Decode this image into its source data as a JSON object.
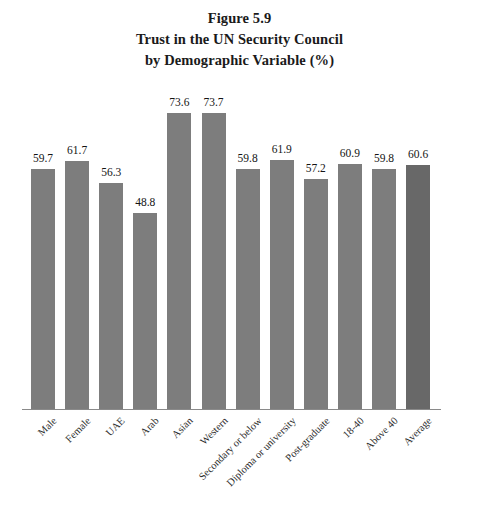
{
  "title": {
    "line1": "Figure 5.9",
    "line2": "Trust in the UN Security Council",
    "line3": "by Demographic Variable (%)"
  },
  "chart_data": {
    "type": "bar",
    "title": "Figure 5.9 Trust in the UN Security Council by Demographic Variable (%)",
    "xlabel": "",
    "ylabel": "",
    "ylim": [
      0,
      80
    ],
    "grid": false,
    "legend": "none",
    "axis": {
      "x_line_visible": true,
      "y_line_visible": false,
      "tick_labels_visible": false
    },
    "bar_color": "#7d7d7d",
    "accent_bar_color": "#686868",
    "accent_category": "Average",
    "categories": [
      "Male",
      "Female",
      "UAE",
      "Arab",
      "Asian",
      "Western",
      "Secondary or below",
      "Diploma or university",
      "Post-graduate",
      "18-40",
      "Above 40",
      "Average"
    ],
    "values": [
      59.7,
      61.7,
      56.3,
      48.8,
      73.6,
      73.7,
      59.8,
      61.9,
      57.2,
      60.9,
      59.8,
      60.6
    ],
    "value_labels": [
      "59.7",
      "61.7",
      "56.3",
      "48.8",
      "73.6",
      "73.7",
      "59.8",
      "61.9",
      "57.2",
      "60.9",
      "59.8",
      "60.6"
    ]
  }
}
